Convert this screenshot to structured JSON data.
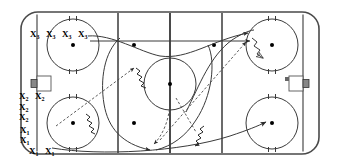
{
  "diagram": {
    "type": "ice-hockey-rink-play-diagram",
    "colors": {
      "ice": "#ffffff",
      "lines": "#3a3a3a",
      "boards": "#4a4a4a",
      "markers": "#000000",
      "labels": "#000000"
    }
  },
  "rink": {
    "boards_label": "rink-boards",
    "left_goal_line_label": "left-goal-line",
    "right_goal_line_label": "right-goal-line",
    "left_blue_line_label": "left-blue-line",
    "right_blue_line_label": "right-blue-line",
    "center_line_label": "center-red-line",
    "center_circle_label": "center-faceoff-circle"
  },
  "faceoff_circles": [
    {
      "name": "top-left-faceoff-circle",
      "cx": 73,
      "cy": 45,
      "r": 26
    },
    {
      "name": "bottom-left-faceoff-circle",
      "cx": 73,
      "cy": 123,
      "r": 26
    },
    {
      "name": "top-right-faceoff-circle",
      "cx": 272,
      "cy": 45,
      "r": 26
    },
    {
      "name": "bottom-right-faceoff-circle",
      "cx": 272,
      "cy": 123,
      "r": 26
    },
    {
      "name": "center-faceoff-circle",
      "cx": 170,
      "cy": 84,
      "r": 26
    }
  ],
  "neutral_zone_dots": [
    {
      "name": "neutral-zone-dot-left",
      "cx": 134,
      "cy": 45
    },
    {
      "name": "neutral-zone-dot-right",
      "cx": 214,
      "cy": 45
    },
    {
      "name": "neutral-zone-dot-bottom-left",
      "cx": 134,
      "cy": 123
    }
  ],
  "goals": [
    {
      "name": "left-goal-net",
      "side": "left"
    },
    {
      "name": "right-goal-net",
      "side": "right"
    }
  ],
  "player_groups": [
    {
      "name": "group-x3-top",
      "label_base": "X",
      "label_sub": "3",
      "count": 4,
      "positions": [
        {
          "x": 32,
          "y": 34
        },
        {
          "x": 48,
          "y": 34
        },
        {
          "x": 64,
          "y": 34
        },
        {
          "x": 80,
          "y": 34
        }
      ]
    },
    {
      "name": "group-x2-left",
      "label_base": "X",
      "label_sub": "2",
      "count": 4,
      "positions": [
        {
          "x": 21,
          "y": 96
        },
        {
          "x": 37,
          "y": 96
        },
        {
          "x": 21,
          "y": 107
        },
        {
          "x": 21,
          "y": 117
        }
      ]
    },
    {
      "name": "group-x1-bottom",
      "label_base": "X",
      "label_sub": "1",
      "count": 4,
      "positions": [
        {
          "x": 22,
          "y": 130
        },
        {
          "x": 22,
          "y": 140
        },
        {
          "x": 31,
          "y": 151
        },
        {
          "x": 46,
          "y": 151
        }
      ]
    }
  ],
  "movement_paths": [
    {
      "name": "skate-path-x3-to-right-top",
      "style": "solid-arrow"
    },
    {
      "name": "skate-path-x3-second-to-right",
      "style": "solid-arrow"
    },
    {
      "name": "skate-path-curve-down-left",
      "style": "solid-arrow"
    },
    {
      "name": "skate-path-x1-to-bottom-right",
      "style": "solid-arrow"
    },
    {
      "name": "pass-path-diagonal-up-right",
      "style": "dashed-arrow"
    },
    {
      "name": "pass-path-diagonal-down-right",
      "style": "dashed-arrow"
    },
    {
      "name": "pass-path-down-to-corner",
      "style": "dashed-arrow"
    },
    {
      "name": "shot-path-to-top-right-net",
      "style": "wavy-dashed-arrow"
    },
    {
      "name": "shot-path-center",
      "style": "wavy-arrow"
    },
    {
      "name": "shot-path-bottom-left",
      "style": "wavy-arrow"
    }
  ]
}
